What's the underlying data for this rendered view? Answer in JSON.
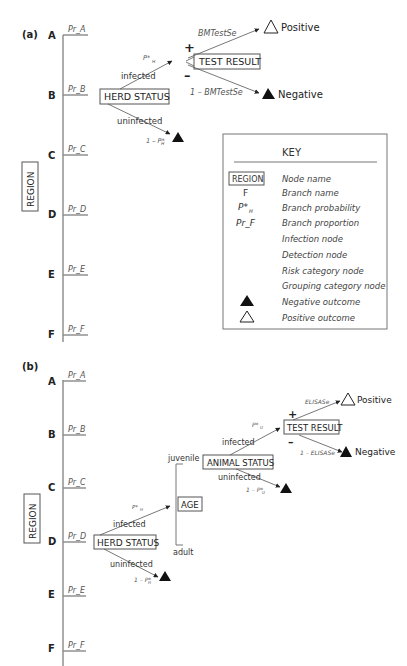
{
  "panel_a": {
    "label": "(a)",
    "root_node": "REGION",
    "regions": [
      {
        "name": "A",
        "proportion": "Pr_A"
      },
      {
        "name": "B",
        "proportion": "Pr_B"
      },
      {
        "name": "C",
        "proportion": "Pr_C"
      },
      {
        "name": "D",
        "proportion": "Pr_D"
      },
      {
        "name": "E",
        "proportion": "Pr_E"
      },
      {
        "name": "F",
        "proportion": "Pr_F"
      }
    ],
    "herd_status": {
      "label": "HERD STATUS",
      "infected_label": "infected",
      "infected_prob": "P*",
      "infected_prob_sub": "H",
      "uninfected_label": "uninfected",
      "uninfected_prob": "1 – P*",
      "uninfected_prob_sub": "H"
    },
    "test_result": {
      "label": "TEST RESULT",
      "plus": "+",
      "minus": "–",
      "positive_prob": "BMTestSe",
      "negative_prob": "1 – BMTestSe",
      "positive_label": "Positive",
      "negative_label": "Negative"
    }
  },
  "key": {
    "title": "KEY",
    "items": [
      {
        "symbol": "REGION",
        "desc": "Node name"
      },
      {
        "symbol": "F",
        "desc": "Branch name"
      },
      {
        "symbol": "P*",
        "symbol_sub": "H",
        "desc": "Branch probability"
      },
      {
        "symbol": "Pr_F",
        "desc": "Branch proportion"
      },
      {
        "symbol": "",
        "desc": "Infection node"
      },
      {
        "symbol": "",
        "desc": "Detection node"
      },
      {
        "symbol": "",
        "desc": "Risk category node"
      },
      {
        "symbol": "",
        "desc": "Grouping category node"
      },
      {
        "symbol": "negative-triangle",
        "desc": "Negative outcome"
      },
      {
        "symbol": "positive-triangle",
        "desc": "Positive outcome"
      }
    ]
  },
  "panel_b": {
    "label": "(b)",
    "root_node": "REGION",
    "regions": [
      {
        "name": "A",
        "proportion": "Pr_A"
      },
      {
        "name": "B",
        "proportion": "Pr_B"
      },
      {
        "name": "C",
        "proportion": "Pr_C"
      },
      {
        "name": "D",
        "proportion": "Pr_D"
      },
      {
        "name": "E",
        "proportion": "Pr_E"
      },
      {
        "name": "F",
        "proportion": "Pr_F"
      }
    ],
    "herd_status": {
      "label": "HERD STATUS",
      "infected_label": "infected",
      "infected_prob": "P*",
      "infected_prob_sub": "H",
      "uninfected_label": "uninfected",
      "uninfected_prob": "1 – P*",
      "uninfected_prob_sub": "H"
    },
    "age": {
      "label": "AGE",
      "juvenile_label": "juvenile",
      "adult_label": "adult"
    },
    "animal_status": {
      "label": "ANIMAL STATUS",
      "infected_label": "infected",
      "infected_prob": "P*",
      "infected_prob_sub": "U",
      "uninfected_label": "uninfected",
      "uninfected_prob": "1 – P*",
      "uninfected_prob_sub": "U"
    },
    "test_result": {
      "label": "TEST RESULT",
      "plus": "+",
      "minus": "–",
      "positive_prob": "ELISASe",
      "negative_prob": "1 – ELISASe",
      "positive_label": "Positive",
      "negative_label": "Negative"
    }
  }
}
